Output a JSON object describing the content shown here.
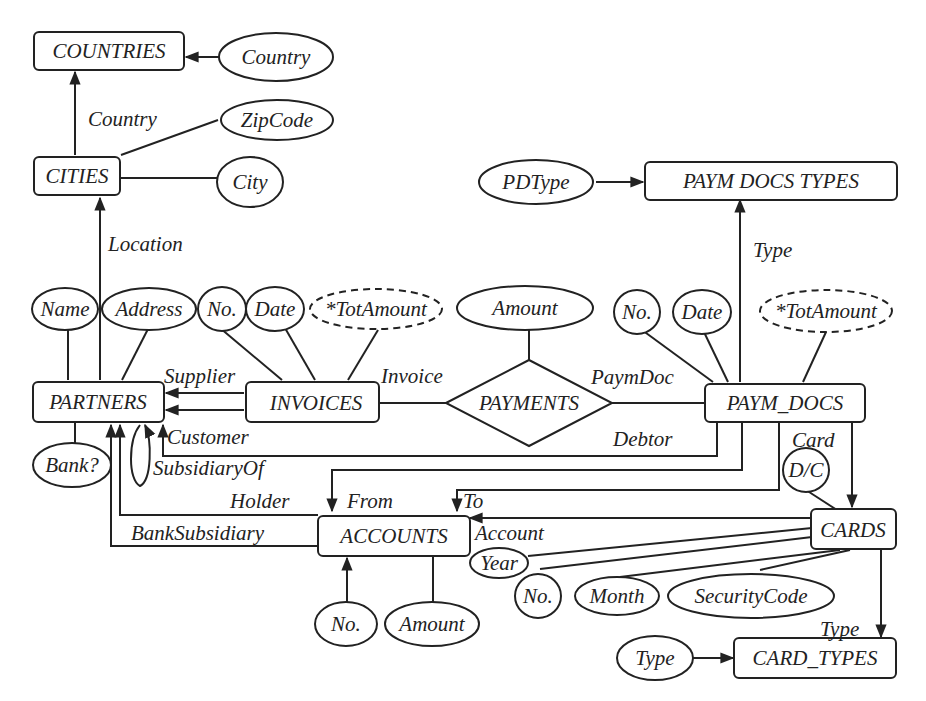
{
  "diagram": {
    "type": "entity-relationship",
    "entities": {
      "countries": "COUNTRIES",
      "cities": "CITIES",
      "partners": "PARTNERS",
      "invoices": "INVOICES",
      "paym_docs": "PAYM_DOCS",
      "paym_docs_types": "PAYM DOCS TYPES",
      "accounts": "ACCOUNTS",
      "cards": "CARDS",
      "card_types": "CARD_TYPES"
    },
    "relationships": {
      "payments": "PAYMENTS"
    },
    "attributes": {
      "countries_country": "Country",
      "cities_zipcode": "ZipCode",
      "cities_city": "City",
      "partners_name": "Name",
      "partners_address": "Address",
      "partners_bank": "Bank?",
      "invoices_no": "No.",
      "invoices_date": "Date",
      "invoices_totamount": "*TotAmount",
      "payments_amount": "Amount",
      "pdt_pdtype": "PDType",
      "paymdocs_no": "No.",
      "paymdocs_date": "Date",
      "paymdocs_totamount": "*TotAmount",
      "paymdocs_dc": "D/C",
      "accounts_no": "No.",
      "accounts_amount": "Amount",
      "cards_year": "Year",
      "cards_no": "No.",
      "cards_month": "Month",
      "cards_securitycode": "SecurityCode",
      "cardtypes_type": "Type"
    },
    "roles": {
      "cities_country": "Country",
      "partners_location": "Location",
      "supplier": "Supplier",
      "customer": "Customer",
      "subsidiary_of": "SubsidiaryOf",
      "holder": "Holder",
      "bank_subsidiary": "BankSubsidiary",
      "invoice": "Invoice",
      "paym_doc": "PaymDoc",
      "debtor": "Debtor",
      "paymdocs_type": "Type",
      "card": "Card",
      "from": "From",
      "to": "To",
      "account": "Account",
      "cards_type": "Type"
    },
    "colors": {
      "stroke": "#222222",
      "background": "#ffffff"
    }
  }
}
